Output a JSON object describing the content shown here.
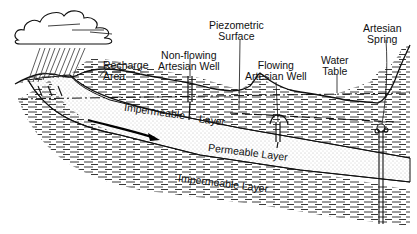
{
  "diagram": {
    "type": "cross-section",
    "labels": {
      "recharge_area": [
        "Recharge",
        "Area"
      ],
      "non_flowing_well": [
        "Non-flowing",
        "Artesian Well"
      ],
      "piezometric_surface": [
        "Piezometric",
        "Surface"
      ],
      "flowing_well": [
        "Flowing",
        "Artesian Well"
      ],
      "water_table": [
        "Water",
        "Table"
      ],
      "artesian_spring": [
        "Artesian",
        "Spring"
      ]
    },
    "layers": {
      "upper_impermeable_left": "Impermeable",
      "upper_impermeable_right": "Layer",
      "permeable": "Permeable Layer",
      "lower_impermeable": "Impermeable Layer"
    },
    "colors": {
      "ink": "#111111",
      "background": "#ffffff",
      "dots": "#777777"
    }
  }
}
